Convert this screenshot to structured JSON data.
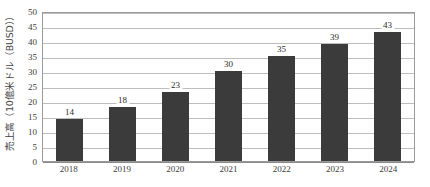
{
  "chart_data": {
    "type": "bar",
    "title": "",
    "subtitle": "",
    "xlabel": "",
    "ylabel": "売上高（10億米ドル（BUSD））",
    "categories": [
      "2018",
      "2019",
      "2020",
      "2021",
      "2022",
      "2023",
      "2024"
    ],
    "values": [
      14,
      18,
      23,
      30,
      35,
      39,
      43
    ],
    "data_labels": [
      "14",
      "18",
      "23",
      "30",
      "35",
      "39",
      "43"
    ],
    "ylim": [
      0,
      50
    ],
    "ytick_step": 5,
    "ytick_labels": [
      "50",
      "45",
      "40",
      "35",
      "30",
      "25",
      "20",
      "15",
      "10",
      "5",
      "0"
    ],
    "grid": "horizontal",
    "legend": "none",
    "series": [
      {
        "name": "売上高",
        "values": [
          14,
          18,
          23,
          30,
          35,
          39,
          43
        ]
      }
    ],
    "colors": {
      "bar": "#3b3b3b",
      "gridline": "#bdbdbd",
      "plot_border": "#9a9a9a",
      "background": "#ffffff",
      "tick_text": "#3d3d3d",
      "label_text": "#2b2b2b",
      "axis_title_text": "#444444"
    }
  }
}
